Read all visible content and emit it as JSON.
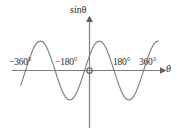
{
  "chart_data": {
    "type": "line",
    "title": "",
    "subtitle": "",
    "xlabel": "θ",
    "ylabel": "sinθ",
    "function": "y = sin θ",
    "xlim": [
      -420,
      420
    ],
    "ylim": [
      -1.35,
      1.35
    ],
    "grid": false,
    "legend_position": "none",
    "origin_label": "O",
    "line_color": "#7d7d7d",
    "axis_color": "#7d7d7d",
    "text_color": "#2b2b2b",
    "x_tick_labels": [
      "−360°",
      "−180°",
      "180°",
      "360°"
    ],
    "x_ticks": [
      -360,
      -180,
      180,
      360
    ],
    "y_ticks": [],
    "y_tick_labels": [],
    "annotations": [],
    "series": [
      {
        "name": "sin θ",
        "x": [
          -420,
          -405,
          -390,
          -375,
          -360,
          -345,
          -330,
          -315,
          -300,
          -285,
          -270,
          -255,
          -240,
          -225,
          -210,
          -195,
          -180,
          -165,
          -150,
          -135,
          -120,
          -105,
          -90,
          -75,
          -60,
          -45,
          -30,
          -15,
          0,
          15,
          30,
          45,
          60,
          75,
          90,
          105,
          120,
          135,
          150,
          165,
          180,
          195,
          210,
          225,
          240,
          255,
          270,
          285,
          300,
          315,
          330,
          345,
          360,
          375,
          390,
          405,
          420
        ],
        "y": [
          -0.5,
          -0.26,
          0,
          0.26,
          0.5,
          0.71,
          0.87,
          0.97,
          1,
          0.97,
          0.87,
          0.71,
          0.5,
          0.26,
          0,
          -0.26,
          -0.5,
          -0.71,
          -0.87,
          -0.97,
          -1,
          -0.97,
          -0.87,
          -0.71,
          -0.5,
          -0.26,
          0,
          0.26,
          0.5,
          0.71,
          0.87,
          0.97,
          1,
          0.97,
          0.87,
          0.71,
          0.5,
          0.26,
          0,
          -0.26,
          -0.5,
          -0.71,
          -0.87,
          -0.97,
          -1,
          -0.97,
          -0.87,
          -0.71,
          -0.5,
          -0.26,
          0,
          0.26,
          0.5,
          0.71,
          0.87,
          0.97,
          1
        ]
      }
    ]
  },
  "figure": {
    "ylabel_text": "sinθ",
    "xlabel_text": "θ",
    "origin_text": "O",
    "tick_neg360": "−360°",
    "tick_neg180": "−180°",
    "tick_180": "180°",
    "tick_360": "360°"
  }
}
